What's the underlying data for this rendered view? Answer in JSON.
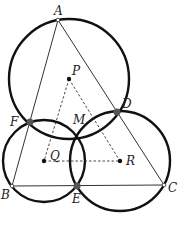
{
  "diagram": {
    "points": {
      "A": {
        "label": "A",
        "x": 58,
        "y": 20
      },
      "P": {
        "label": "P",
        "x": 69,
        "y": 79
      },
      "D": {
        "label": "D",
        "x": 117,
        "y": 112
      },
      "F": {
        "label": "F",
        "x": 30,
        "y": 122
      },
      "M": {
        "label": "M",
        "x": 78,
        "y": 137
      },
      "Q": {
        "label": "Q",
        "x": 44,
        "y": 161
      },
      "R": {
        "label": "R",
        "x": 120,
        "y": 161
      },
      "B": {
        "label": "B",
        "x": 12,
        "y": 186
      },
      "E": {
        "label": "E",
        "x": 77,
        "y": 186
      },
      "C": {
        "label": "C",
        "x": 164,
        "y": 185
      }
    },
    "circles": [
      {
        "center": "P",
        "r": 60
      },
      {
        "center": "Q",
        "r": 41
      },
      {
        "center": "R",
        "r": 50
      }
    ],
    "colors": {
      "stroke": "#111111",
      "marker": "#555555"
    }
  }
}
